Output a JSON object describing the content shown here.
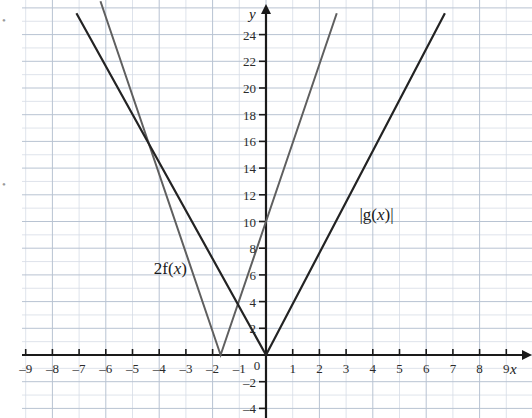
{
  "chart_data": {
    "type": "line",
    "title": "",
    "xlabel": "x",
    "ylabel": "y",
    "xlim": [
      -9.2,
      9.2
    ],
    "ylim": [
      -4.6,
      25.6
    ],
    "grid": true,
    "grid_step_minor": 1,
    "grid_step_major": 2,
    "legend_position": "inline-annotations",
    "x_ticks": [
      -9,
      -8,
      -7,
      -6,
      -5,
      -4,
      -3,
      -2,
      -1,
      0,
      1,
      2,
      3,
      4,
      5,
      6,
      7,
      8,
      9
    ],
    "x_tick_labels": [
      "–9",
      "–8",
      "–7",
      "–6",
      "–5",
      "–4",
      "–3",
      "–2",
      "–1",
      "0",
      "1",
      "2",
      "3",
      "4",
      "5",
      "6",
      "7",
      "8",
      "9"
    ],
    "y_ticks": [
      -4,
      -2,
      2,
      4,
      6,
      8,
      10,
      12,
      14,
      16,
      18,
      20,
      22,
      24
    ],
    "y_tick_labels": [
      "–4",
      "–2",
      "2",
      "4",
      "6",
      "8",
      "10",
      "12",
      "14",
      "16",
      "18",
      "20",
      "22",
      "24"
    ],
    "origin_label": "0",
    "series": [
      {
        "name": "2f(x)",
        "label": "2f(x)",
        "color": "#5f5f5f",
        "width": 2.0,
        "shape": "absolute-value-v",
        "vertex": [
          -1.7,
          0
        ],
        "slope_right": 5.88,
        "slope_left": -5.88,
        "y_intercept": 10,
        "points": [
          [
            -6.2,
            26.5
          ],
          [
            -1.7,
            0
          ],
          [
            2.65,
            25.6
          ]
        ],
        "annotation": {
          "text": "2f(x)",
          "x": -4.2,
          "y": 7.2
        }
      },
      {
        "name": "|g(x)|",
        "label": "|g(x)|",
        "color": "#232323",
        "width": 2.2,
        "shape": "absolute-value-v",
        "vertex": [
          0,
          0
        ],
        "slope_right": 3.6,
        "slope_left": -3.6,
        "y_intercept": 0,
        "points": [
          [
            -7.1,
            25.6
          ],
          [
            0,
            0
          ],
          [
            6.7,
            25.6
          ]
        ],
        "annotation": {
          "text": "|g(x)|",
          "x": 3.5,
          "y": 11.2
        }
      }
    ],
    "colors": {
      "grid_minor": "#d5dce6",
      "grid_major": "#b8c3d2",
      "axis": "#1a1a1a",
      "background": "#ffffff",
      "series_2fx": "#5f5f5f",
      "series_gx": "#232323"
    }
  },
  "axes": {
    "x_axis_name": "x",
    "y_axis_name": "y"
  },
  "annotations": {
    "series_a_label": "2f(x)",
    "series_b_label": "|g(x)|"
  },
  "margin_marks": {
    "top_left": "•",
    "bottom_left": "•"
  }
}
